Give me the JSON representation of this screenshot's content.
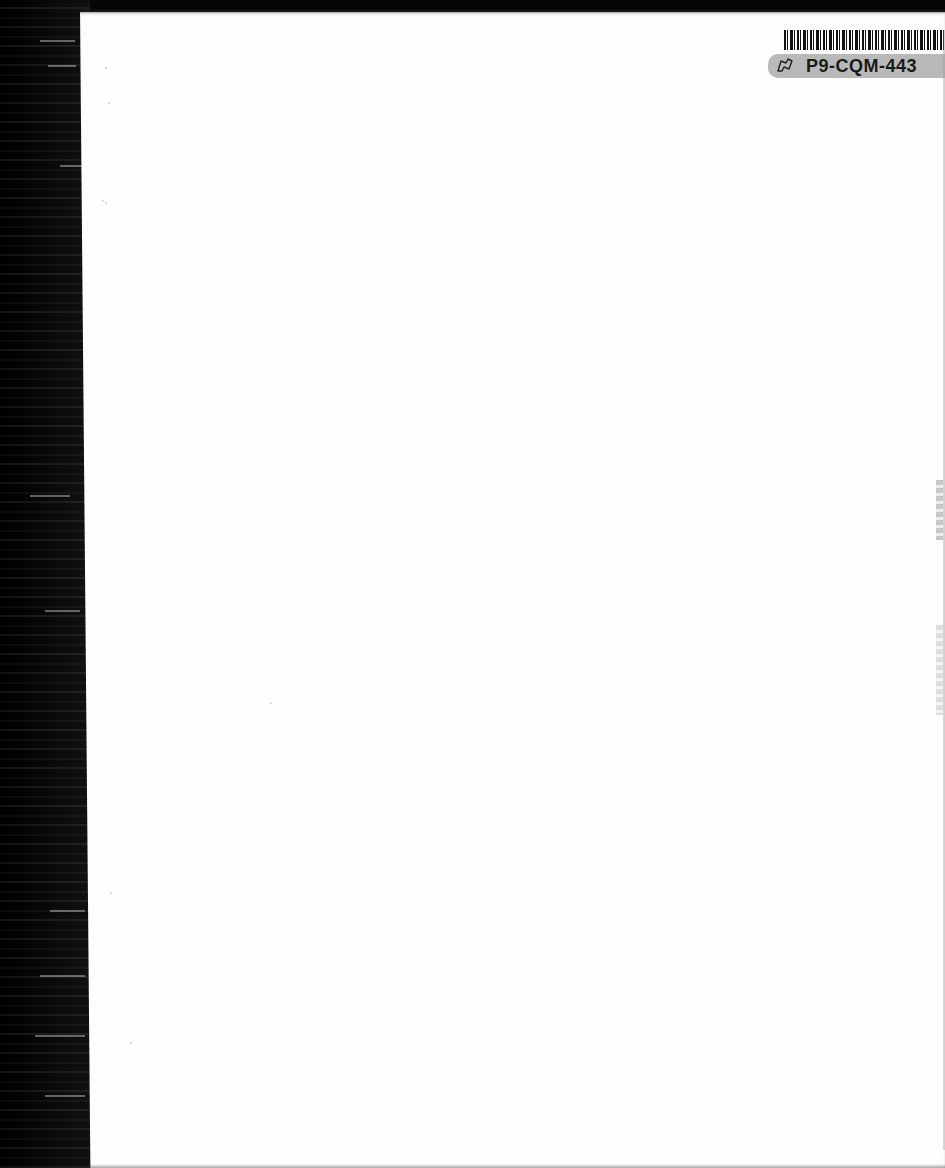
{
  "document": {
    "type": "scanned-blank-page",
    "barcode_label": {
      "code": "P9-CQM-443",
      "icon": "flag-outline-icon"
    },
    "colors": {
      "page": "#fdfdfc",
      "binding": "#050505",
      "label_strip": "#b9b9b9",
      "label_text": "#1a1a1a"
    }
  }
}
